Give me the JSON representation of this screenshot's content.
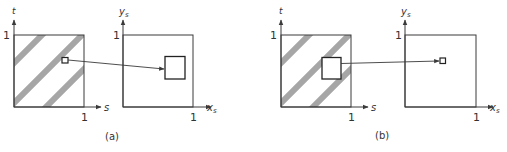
{
  "figure": {
    "panels": [
      {
        "id": "a",
        "caption": "(a)",
        "texture_space": {
          "x_axis_label": "s",
          "y_axis_label": "t",
          "x_tick": "1",
          "y_tick": "1",
          "sample_box": "small"
        },
        "screen_space": {
          "x_axis_label": "x",
          "x_axis_subscript": "s",
          "y_axis_label": "y",
          "y_axis_subscript": "s",
          "x_tick": "1",
          "y_tick": "1",
          "pixel_box": "large"
        },
        "description": "Magnification: small texture region maps to large screen area"
      },
      {
        "id": "b",
        "caption": "(b)",
        "texture_space": {
          "x_axis_label": "s",
          "y_axis_label": "t",
          "x_tick": "1",
          "y_tick": "1",
          "sample_box": "large"
        },
        "screen_space": {
          "x_axis_label": "x",
          "x_axis_subscript": "s",
          "y_axis_label": "y",
          "y_axis_subscript": "s",
          "x_tick": "1",
          "y_tick": "1",
          "pixel_box": "small"
        },
        "description": "Minification: large texture region maps to small screen area"
      }
    ],
    "colors": {
      "line": "#3a3a3a",
      "stripe": "#a6a6a6",
      "background": "#ffffff"
    }
  }
}
